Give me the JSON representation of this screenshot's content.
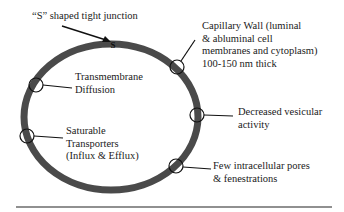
{
  "diagram": {
    "type": "blood-brain barrier capillary cross-section",
    "colors": {
      "wall": "#4a4a4a",
      "line": "#111111",
      "text": "#1a1a1a"
    },
    "junction_glyph": "S",
    "labels": {
      "tight_junction": [
        "“S” shaped tight junction"
      ],
      "capillary_wall": [
        "Capillary Wall (luminal",
        "& abluminal cell",
        "membranes and cytoplasm)",
        "100-150 nm thick"
      ],
      "transmembrane": [
        "Transmembrane",
        "Diffusion"
      ],
      "vesicular": [
        "Decreased vesicular",
        "activity"
      ],
      "transporters": [
        "Saturable",
        "Transporters",
        "(Influx & Efflux)"
      ],
      "pores": [
        "Few intracellular pores",
        "& fenestrations"
      ]
    }
  }
}
